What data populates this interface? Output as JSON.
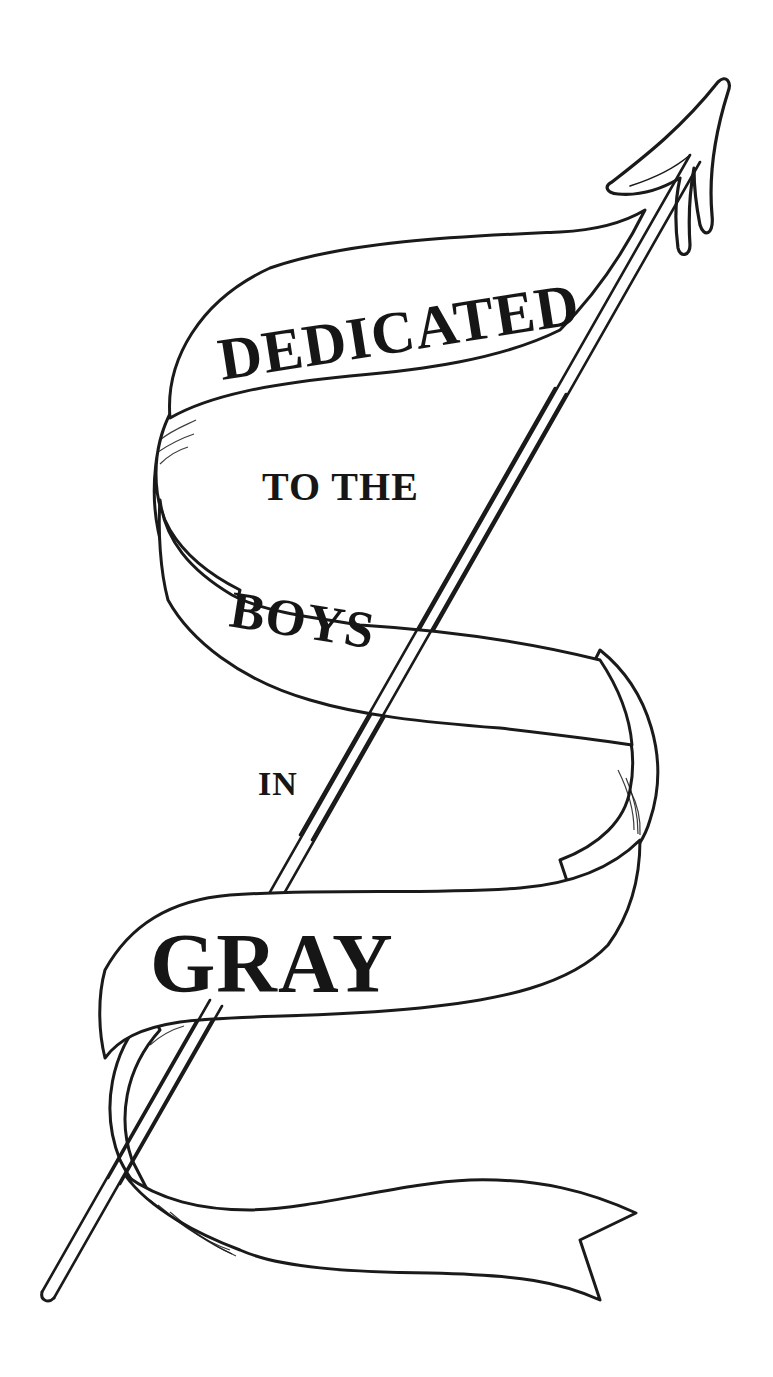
{
  "illustration": {
    "description": "Pen-and-ink ribbon banner wrapped around an arrow",
    "ink_color": "#1a1a1a",
    "background": "#ffffff",
    "lines": [
      {
        "id": "line1",
        "text": "DEDICATED"
      },
      {
        "id": "line2",
        "text": "TO THE"
      },
      {
        "id": "line3",
        "text": "BOYS"
      },
      {
        "id": "line4",
        "text": "IN"
      },
      {
        "id": "line5",
        "text": "GRAY"
      }
    ]
  }
}
